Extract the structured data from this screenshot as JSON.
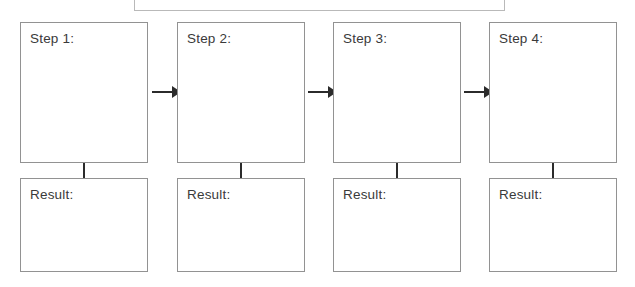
{
  "diagram": {
    "title_bar": {
      "label": "",
      "visible_partially": true
    },
    "columns": [
      {
        "step_label": "Step 1:",
        "step_content": "",
        "result_label": "Result:",
        "result_content": "",
        "arrow_after": true
      },
      {
        "step_label": "Step 2:",
        "step_content": "",
        "result_label": "Result:",
        "result_content": "",
        "arrow_after": true
      },
      {
        "step_label": "Step 3:",
        "step_content": "",
        "result_label": "Result:",
        "result_content": "",
        "arrow_after": true
      },
      {
        "step_label": "Step 4:",
        "step_content": "",
        "result_label": "Result:",
        "result_content": "",
        "arrow_after": false
      }
    ],
    "colors": {
      "background": "#ffffff",
      "box_border": "#929292",
      "top_bar_border": "#b9b9b9",
      "text": "#3a3a3a",
      "connector": "#2b2b2b",
      "arrow": "#2b2b2b"
    }
  }
}
